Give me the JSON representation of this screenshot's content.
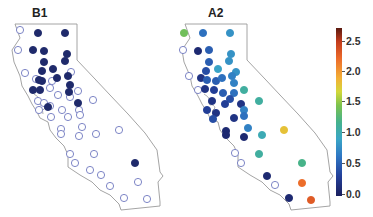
{
  "chart_data": {
    "type": "scatter",
    "subtype": "geographic point map (California outline)",
    "panels": [
      {
        "title": "B1",
        "note": "filled dots = values shown in dark navy (~0.0), open circles = no/zero value",
        "points_filled": [
          [
            38,
            33
          ],
          [
            65,
            33
          ],
          [
            33,
            50
          ],
          [
            44,
            51
          ],
          [
            67,
            54
          ],
          [
            44,
            62
          ],
          [
            65,
            61
          ],
          [
            53,
            69
          ],
          [
            42,
            71
          ],
          [
            39,
            80
          ],
          [
            57,
            78
          ],
          [
            68,
            76
          ],
          [
            42,
            81
          ],
          [
            70,
            85
          ],
          [
            33,
            90
          ],
          [
            40,
            90
          ],
          [
            69,
            92
          ],
          [
            48,
            107
          ],
          [
            78,
            103
          ],
          [
            135,
            163
          ]
        ],
        "points_open": [
          [
            20,
            30
          ],
          [
            18,
            50
          ],
          [
            25,
            73
          ],
          [
            36,
            79
          ],
          [
            52,
            81
          ],
          [
            71,
            72
          ],
          [
            50,
            88
          ],
          [
            78,
            91
          ],
          [
            58,
            95
          ],
          [
            70,
            97
          ],
          [
            93,
            100
          ],
          [
            38,
            101
          ],
          [
            44,
            103
          ],
          [
            39,
            110
          ],
          [
            50,
            106
          ],
          [
            62,
            110
          ],
          [
            79,
            110
          ],
          [
            80,
            115
          ],
          [
            68,
            117
          ],
          [
            51,
            117
          ],
          [
            82,
            127
          ],
          [
            61,
            129
          ],
          [
            61,
            134
          ],
          [
            79,
            136
          ],
          [
            96,
            134
          ],
          [
            119,
            130
          ],
          [
            70,
            154
          ],
          [
            94,
            154
          ],
          [
            75,
            163
          ],
          [
            90,
            170
          ],
          [
            101,
            175
          ],
          [
            110,
            186
          ],
          [
            138,
            182
          ],
          [
            124,
            198
          ],
          [
            147,
            199
          ]
        ]
      },
      {
        "title": "A2",
        "note": "dots colored by value on colorbar 0.0–2.7",
        "points": [
          {
            "x": 184,
            "y": 33,
            "v": 1.4
          },
          {
            "x": 203,
            "y": 33,
            "v": 0.6
          },
          {
            "x": 230,
            "y": 33,
            "v": 0.8
          },
          {
            "x": 183,
            "y": 50,
            "v": null
          },
          {
            "x": 198,
            "y": 51,
            "v": 0.1
          },
          {
            "x": 209,
            "y": 50,
            "v": 0.5
          },
          {
            "x": 231,
            "y": 54,
            "v": 0.8
          },
          {
            "x": 209,
            "y": 62,
            "v": 0.5
          },
          {
            "x": 229,
            "y": 61,
            "v": 0.8
          },
          {
            "x": 218,
            "y": 69,
            "v": 0.9
          },
          {
            "x": 206,
            "y": 71,
            "v": 0.4
          },
          {
            "x": 236,
            "y": 72,
            "v": 0.8
          },
          {
            "x": 189,
            "y": 76,
            "v": null
          },
          {
            "x": 201,
            "y": 78,
            "v": 0.2
          },
          {
            "x": 207,
            "y": 80,
            "v": 0.5
          },
          {
            "x": 216,
            "y": 81,
            "v": 0.5
          },
          {
            "x": 222,
            "y": 78,
            "v": 0.6
          },
          {
            "x": 232,
            "y": 76,
            "v": 0.7
          },
          {
            "x": 234,
            "y": 83,
            "v": 0.7
          },
          {
            "x": 244,
            "y": 90,
            "v": 1.1
          },
          {
            "x": 198,
            "y": 90,
            "v": null
          },
          {
            "x": 205,
            "y": 89,
            "v": 0.2
          },
          {
            "x": 214,
            "y": 90,
            "v": 0.3
          },
          {
            "x": 223,
            "y": 93,
            "v": 0.5
          },
          {
            "x": 234,
            "y": 93,
            "v": 0.6
          },
          {
            "x": 230,
            "y": 99,
            "v": 0.4
          },
          {
            "x": 259,
            "y": 101,
            "v": 1.1
          },
          {
            "x": 212,
            "y": 101,
            "v": 0.2
          },
          {
            "x": 225,
            "y": 104,
            "v": 0.3
          },
          {
            "x": 241,
            "y": 104,
            "v": 0.2
          },
          {
            "x": 244,
            "y": 110,
            "v": 0.7
          },
          {
            "x": 207,
            "y": 110,
            "v": 0.3
          },
          {
            "x": 216,
            "y": 113,
            "v": 0.2
          },
          {
            "x": 234,
            "y": 118,
            "v": 0.2
          },
          {
            "x": 244,
            "y": 116,
            "v": 0.6
          },
          {
            "x": 213,
            "y": 119,
            "v": 0.4
          },
          {
            "x": 248,
            "y": 128,
            "v": 0.7
          },
          {
            "x": 226,
            "y": 131,
            "v": 0.1
          },
          {
            "x": 226,
            "y": 135,
            "v": 0.1
          },
          {
            "x": 262,
            "y": 135,
            "v": 1.0
          },
          {
            "x": 284,
            "y": 130,
            "v": 1.8
          },
          {
            "x": 244,
            "y": 137,
            "v": 0.1
          },
          {
            "x": 235,
            "y": 153,
            "v": null
          },
          {
            "x": 259,
            "y": 154,
            "v": 1.1
          },
          {
            "x": 241,
            "y": 163,
            "v": null
          },
          {
            "x": 302,
            "y": 163,
            "v": 1.2
          },
          {
            "x": 267,
            "y": 176,
            "v": 0.1
          },
          {
            "x": 302,
            "y": 183,
            "v": 2.2
          },
          {
            "x": 275,
            "y": 185,
            "v": null
          },
          {
            "x": 289,
            "y": 198,
            "v": 0.1
          },
          {
            "x": 311,
            "y": 200,
            "v": 2.3
          }
        ]
      }
    ],
    "colorbar": {
      "min": 0.0,
      "max": 2.7,
      "ticks": [
        "0.0",
        "0.5",
        "1.0",
        "1.5",
        "2.0",
        "2.5"
      ],
      "colormap": "jet-like (navy → blue → cyan → green → yellow → orange → dark red)"
    },
    "xlabel": "",
    "ylabel": "",
    "grid": false,
    "legend_position": "right colorbar"
  },
  "labels": {
    "panel_b1": "B1",
    "panel_a2": "A2",
    "ticks": {
      "t0": "0.0",
      "t1": "0.5",
      "t2": "1.0",
      "t3": "1.5",
      "t4": "2.0",
      "t5": "2.5"
    }
  },
  "colors": {
    "filled_dot": "#1f2a6b",
    "open_dot_stroke": "#6f78c0",
    "outline": "#9a9a9a"
  }
}
